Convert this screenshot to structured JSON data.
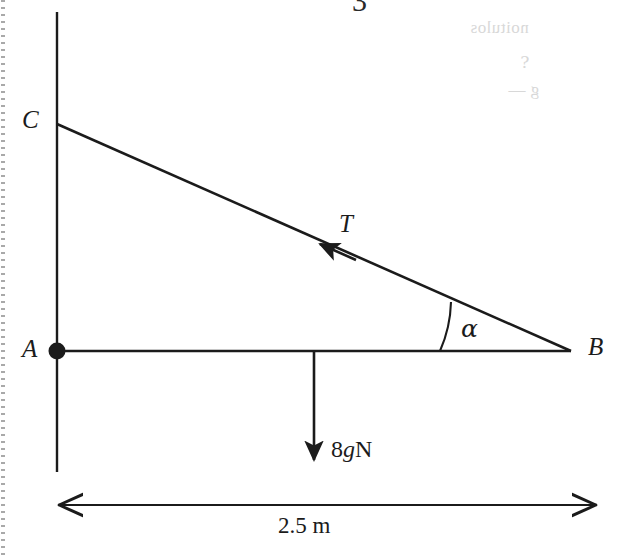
{
  "figure": {
    "type": "mechanics-free-body-diagram",
    "width": 625,
    "height": 556,
    "background_color": "#ffffff",
    "line_color": "#1b1b1b"
  },
  "points": {
    "A": {
      "label": "A",
      "x": 57,
      "y": 351,
      "label_x": 22,
      "label_y": 337,
      "has_dot": true
    },
    "B": {
      "label": "B",
      "x": 570,
      "y": 351,
      "label_x": 588,
      "label_y": 335,
      "has_dot": false
    },
    "C": {
      "label": "C",
      "x": 57,
      "y": 124,
      "label_x": 23,
      "label_y": 109,
      "has_dot": false
    }
  },
  "segments": {
    "vertical_wall": {
      "x": 57,
      "y1": 12,
      "y2": 472
    },
    "rod_AB": {
      "x1": 57,
      "y1": 351,
      "x2": 570,
      "y2": 351
    },
    "string_CB": {
      "x1": 57,
      "y1": 124,
      "x2": 570,
      "y2": 351
    }
  },
  "tension": {
    "label": "T",
    "label_x": 340,
    "label_y": 212,
    "arrow_tip_x": 318,
    "arrow_tip_y": 243,
    "arrow_tail_x": 352,
    "arrow_tail_y": 258,
    "direction": "towards C along string"
  },
  "weight": {
    "label": "8gN",
    "label_parts": {
      "magnitude": "8",
      "gravity": "g",
      "unit": "N"
    },
    "label_x": 331,
    "label_y": 438,
    "arrow_x": 314,
    "arrow_y_start": 351,
    "arrow_y_end": 466,
    "direction": "down"
  },
  "angle": {
    "label": "α",
    "label_x": 462,
    "label_y": 316,
    "vertex": "B",
    "radius": 130,
    "arc_start_x": 440,
    "arc_start_y": 351,
    "arc_end_x": 450,
    "arc_end_y": 302,
    "measured_degrees": 23.9
  },
  "dimension": {
    "label": "2.5 m",
    "value": "2.5",
    "unit": "m",
    "label_x": 277,
    "label_y": 515,
    "line_y": 505,
    "x_start": 57,
    "x_end": 598,
    "style": "double-headed-arrow"
  },
  "artifacts": {
    "left_edge_dotted_margin": true,
    "top_cropped_glyph": "3",
    "bleed_through_lines": [
      {
        "text": "noitulos",
        "x": 470,
        "y": 18
      },
      {
        "text": "⸮",
        "x": 520,
        "y": 52
      },
      {
        "text": "g —",
        "x": 508,
        "y": 80
      }
    ]
  }
}
